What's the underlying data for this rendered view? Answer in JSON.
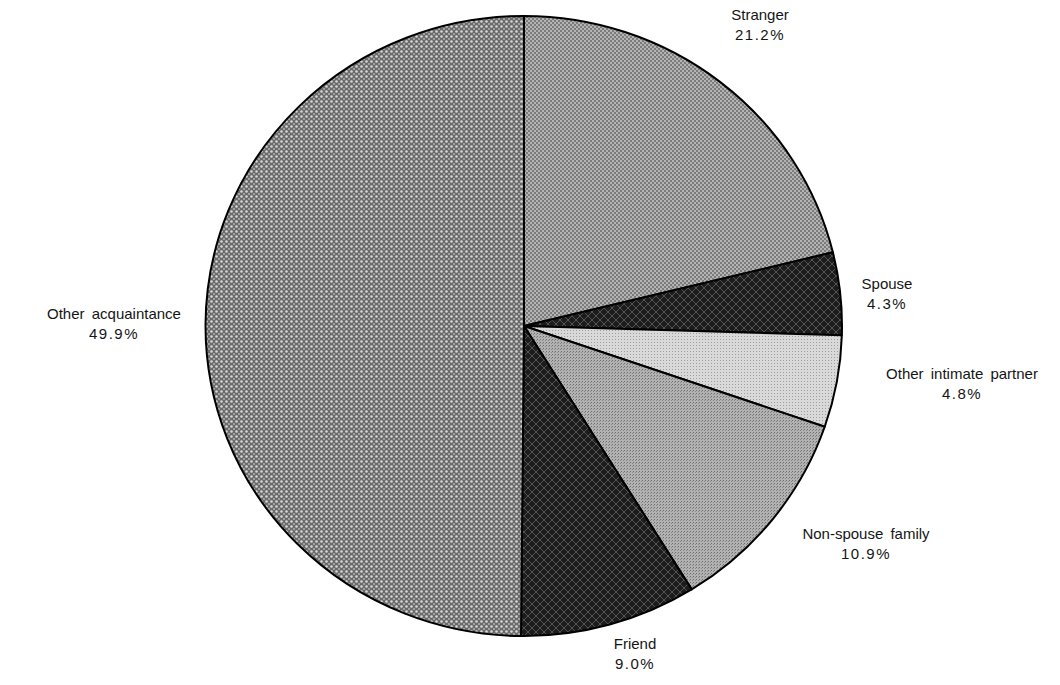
{
  "chart_data": {
    "type": "pie",
    "title": "",
    "start_angle_deg": 90,
    "direction": "clockwise",
    "slices": [
      {
        "label": "Stranger",
        "value": 21.2,
        "pct_text": "21.2%",
        "fill": "#8a8a8a",
        "pattern": "fine-dot"
      },
      {
        "label": "Spouse",
        "value": 4.3,
        "pct_text": "4.3%",
        "fill": "#2a2a2a",
        "pattern": "dark-crosshatch"
      },
      {
        "label": "Other intimate partner",
        "value": 4.8,
        "pct_text": "4.8%",
        "fill": "#d2d2d2",
        "pattern": "light-dot"
      },
      {
        "label": "Non-spouse family",
        "value": 10.9,
        "pct_text": "10.9%",
        "fill": "#a6a6a6",
        "pattern": "medium-dot"
      },
      {
        "label": "Friend",
        "value": 9.0,
        "pct_text": "9.0%",
        "fill": "#262626",
        "pattern": "dark-crosshatch"
      },
      {
        "label": "Other acquaintance",
        "value": 49.9,
        "pct_text": "49.9%",
        "fill": "#8c8c8c",
        "pattern": "coarse-dot"
      }
    ],
    "legend": "none (labels placed beside slices)"
  },
  "labels": {
    "stranger": {
      "name": "Stranger",
      "pct": "21.2%"
    },
    "spouse": {
      "name": "Spouse",
      "pct": "4.3%"
    },
    "other_intimate_partner": {
      "name": "Other intimate partner",
      "pct": "4.8%"
    },
    "non_spouse_family": {
      "name": "Non-spouse family",
      "pct": "10.9%"
    },
    "friend": {
      "name": "Friend",
      "pct": "9.0%"
    },
    "other_acquaintance": {
      "name": "Other acquaintance",
      "pct": "49.9%"
    }
  }
}
